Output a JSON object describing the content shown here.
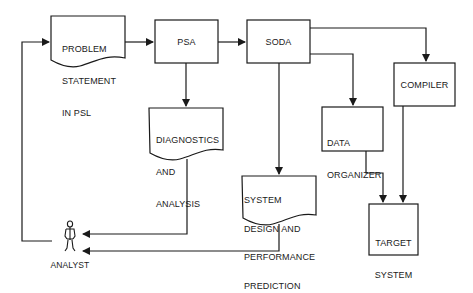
{
  "diagram": {
    "nodes": [
      {
        "id": "problem_statement",
        "shape": "document",
        "lines": [
          "PROBLEM",
          "STATEMENT",
          "IN PSL"
        ]
      },
      {
        "id": "psa",
        "shape": "box",
        "lines": [
          "PSA"
        ]
      },
      {
        "id": "soda",
        "shape": "box",
        "lines": [
          "SODA"
        ]
      },
      {
        "id": "diagnostics",
        "shape": "document",
        "lines": [
          "DIAGNOSTICS",
          "AND",
          "ANALYSIS"
        ]
      },
      {
        "id": "compiler",
        "shape": "box",
        "lines": [
          "COMPILER"
        ]
      },
      {
        "id": "data_organizer",
        "shape": "box",
        "lines": [
          "DATA",
          "ORGANIZER"
        ]
      },
      {
        "id": "system_design",
        "shape": "document",
        "lines": [
          "SYSTEM",
          "DESIGN AND",
          "PERFORMANCE",
          "PREDICTION"
        ]
      },
      {
        "id": "target_system",
        "shape": "box",
        "lines": [
          "TARGET",
          "SYSTEM"
        ]
      },
      {
        "id": "analyst",
        "shape": "stick-figure",
        "lines": [
          "ANALYST"
        ]
      }
    ],
    "edges": [
      {
        "from": "analyst",
        "to": "problem_statement"
      },
      {
        "from": "problem_statement",
        "to": "psa"
      },
      {
        "from": "psa",
        "to": "soda"
      },
      {
        "from": "psa",
        "to": "diagnostics"
      },
      {
        "from": "soda",
        "to": "compiler"
      },
      {
        "from": "soda",
        "to": "data_organizer"
      },
      {
        "from": "soda",
        "to": "system_design"
      },
      {
        "from": "data_organizer",
        "to": "target_system"
      },
      {
        "from": "compiler",
        "to": "target_system"
      },
      {
        "from": "diagnostics",
        "to": "analyst"
      },
      {
        "from": "system_design",
        "to": "analyst"
      }
    ],
    "labels": {
      "problem_statement": {
        "l1": "PROBLEM",
        "l2": "STATEMENT",
        "l3": "IN PSL"
      },
      "psa": "PSA",
      "soda": "SODA",
      "diagnostics": {
        "l1": "DIAGNOSTICS",
        "l2": "AND",
        "l3": "ANALYSIS"
      },
      "compiler": "COMPILER",
      "data_organizer": {
        "l1": "DATA",
        "l2": "ORGANIZER"
      },
      "system_design": {
        "l1": "SYSTEM",
        "l2": "DESIGN AND",
        "l3": "PERFORMANCE",
        "l4": "PREDICTION"
      },
      "target_system": {
        "l1": "TARGET",
        "l2": "SYSTEM"
      },
      "analyst": "ANALYST"
    },
    "colors": {
      "line": "#1a1a1a",
      "background": "#ffffff"
    }
  }
}
